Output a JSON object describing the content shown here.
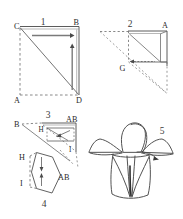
{
  "figure": {
    "background_color": "#ffffff",
    "line_color": "#4a4a4a",
    "dash_color": "#6b6b6b",
    "label_color": "#2a2a2a"
  },
  "panels": [
    {
      "number": "1",
      "caption_position": "top",
      "vertex_labels": [
        {
          "text": "C",
          "corner": "top-left"
        },
        {
          "text": "B",
          "corner": "top-right"
        },
        {
          "text": "A",
          "corner": "bottom-left"
        },
        {
          "text": "D",
          "corner": "bottom-right"
        }
      ],
      "arrows": [
        {
          "name": "horizontal-fold-arrow",
          "direction": "right"
        },
        {
          "name": "vertical-fold-arrow",
          "direction": "up"
        }
      ],
      "description": "Square sheet with diagonal C-D, dashed left and bottom edges"
    },
    {
      "number": "2",
      "caption_position": "top",
      "vertex_labels": [
        {
          "text": "A",
          "corner": "top-right"
        },
        {
          "text": "G",
          "corner": "bottom-left"
        }
      ],
      "arrows": [
        {
          "name": "inward-fold-arrow",
          "direction": "left"
        }
      ],
      "description": "Folded triangle with dotted guide lines radiating to the left and below"
    },
    {
      "number": "3",
      "caption_position": "top",
      "vertex_labels": [
        {
          "text": "B",
          "corner": "left"
        },
        {
          "text": "AB",
          "corner": "top-right"
        },
        {
          "text": "H",
          "corner": "inner-left"
        },
        {
          "text": "I",
          "corner": "bottom-right"
        }
      ],
      "arrows": [
        {
          "name": "petal-fold-arrow",
          "direction": "down-left"
        }
      ],
      "description": "Triangle with inner fold flaps and dashed creases"
    },
    {
      "number": "4",
      "caption_position": "bottom",
      "vertex_labels": [
        {
          "text": "H",
          "corner": "top-left"
        },
        {
          "text": "I",
          "corner": "bottom-left"
        },
        {
          "text": "AB",
          "corner": "right"
        }
      ],
      "arrows": [
        {
          "name": "downward-fold-arrow",
          "direction": "down"
        },
        {
          "name": "upward-fold-arrow",
          "direction": "up"
        }
      ],
      "description": "Kite shaped folded unit with two opposing arrows inside"
    },
    {
      "number": "5",
      "caption_position": "top-right",
      "vertex_labels": [],
      "arrows": [],
      "description": "Finished origami flower / lily model, freehand sketched"
    }
  ]
}
